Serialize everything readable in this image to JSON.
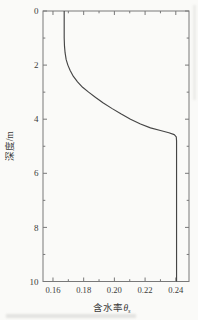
{
  "figure": {
    "background": "#fafaf8",
    "axis_color": "#787878",
    "text_color": "#3a3a3a"
  },
  "chart_data": {
    "type": "line",
    "title": "",
    "xlabel": "含水率θs",
    "xlabel_parts": {
      "prefix": "含水率",
      "symbol": "θ",
      "subscript": "s"
    },
    "ylabel": "深度/m",
    "xlim": [
      0.1535,
      0.2486
    ],
    "ylim": [
      0,
      10
    ],
    "y_axis_inverted": true,
    "grid": false,
    "legend": null,
    "frame": "closed-box-inward-ticks",
    "x_ticks": {
      "major": [
        0.16,
        0.18,
        0.2,
        0.22,
        0.24
      ],
      "minor": [
        0.17,
        0.19,
        0.21,
        0.23
      ],
      "labels": [
        "0.16",
        "0.18",
        "0.20",
        "0.22",
        "0.24"
      ]
    },
    "y_ticks": {
      "major": [
        0,
        2,
        4,
        6,
        8,
        10
      ],
      "minor": [
        1,
        3,
        5,
        7,
        9
      ],
      "labels": [
        "0",
        "2",
        "4",
        "6",
        "8",
        "10"
      ]
    },
    "series": [
      {
        "name": "water-content-depth-profile",
        "color": "#454545",
        "points_theta_depth": [
          [
            0.1673,
            0.0
          ],
          [
            0.1673,
            1.0
          ],
          [
            0.1675,
            1.3
          ],
          [
            0.1679,
            1.55
          ],
          [
            0.1686,
            1.8
          ],
          [
            0.1697,
            2.0
          ],
          [
            0.1712,
            2.2
          ],
          [
            0.1733,
            2.42
          ],
          [
            0.176,
            2.62
          ],
          [
            0.1793,
            2.82
          ],
          [
            0.1832,
            3.0
          ],
          [
            0.1878,
            3.2
          ],
          [
            0.1928,
            3.4
          ],
          [
            0.1983,
            3.6
          ],
          [
            0.2042,
            3.8
          ],
          [
            0.2105,
            4.0
          ],
          [
            0.217,
            4.18
          ],
          [
            0.2235,
            4.32
          ],
          [
            0.23,
            4.42
          ],
          [
            0.2355,
            4.5
          ],
          [
            0.239,
            4.57
          ],
          [
            0.2403,
            4.65
          ],
          [
            0.2405,
            4.8
          ],
          [
            0.2405,
            10.0
          ]
        ]
      }
    ]
  }
}
